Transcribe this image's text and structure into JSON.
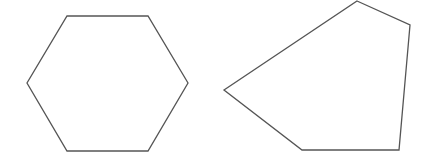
{
  "canvas": {
    "width": 428,
    "height": 168,
    "background": "#ffffff"
  },
  "stroke_color": "#555555",
  "shapes": [
    {
      "name": "hexagon",
      "sides": 6,
      "points": "67,16 148,16 188,83 148,151 67,151 27,83"
    },
    {
      "name": "pentagon",
      "sides": 5,
      "points": "357,1 410,25 399,150 302,150 224,90"
    }
  ]
}
